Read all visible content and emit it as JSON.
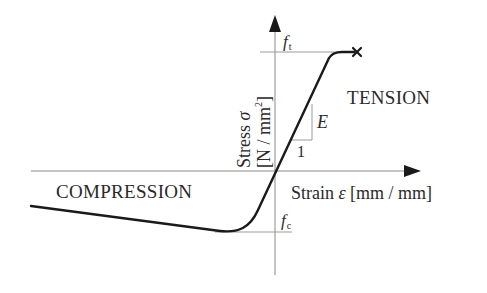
{
  "diagram": {
    "y_axis": {
      "label_main": "Stress",
      "symbol": "σ",
      "unit": "[N / mm²]",
      "unit_base": "[N / mm",
      "unit_sup": "2",
      "unit_close": "]"
    },
    "x_axis": {
      "label_main": "Strain",
      "symbol": "ε",
      "unit": "[mm / mm]"
    },
    "regions": {
      "tension": "TENSION",
      "compression": "COMPRESSION"
    },
    "markers": {
      "ft": {
        "base": "f",
        "sub": "t"
      },
      "fc": {
        "base": "f",
        "sub": "c"
      }
    },
    "slope_triangle": {
      "rise_label": "E",
      "run_label": "1"
    },
    "failure_marker": "×"
  },
  "colors": {
    "curve": "#1a1a1a",
    "axis": "#8a8a8a",
    "text": "#2a2a2a",
    "guide": "#9a9a9a"
  }
}
